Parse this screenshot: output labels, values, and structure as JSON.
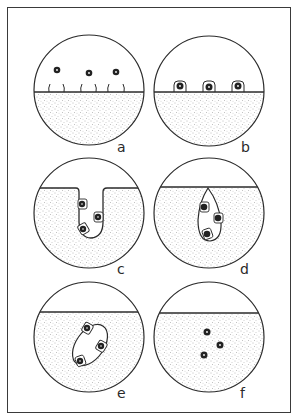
{
  "figure": {
    "colors": {
      "line": "#2b2b2b",
      "stipple": "#8a8a8a",
      "background": "#ffffff",
      "cell": "#222222"
    },
    "panels": [
      {
        "id": "a",
        "label": "a",
        "cx": 89,
        "cy": 90,
        "r": 55,
        "surface_y": 92,
        "label_pos": [
          118,
          138
        ],
        "stage": "free particles above surface with receptors"
      },
      {
        "id": "b",
        "label": "b",
        "cx": 209,
        "cy": 91,
        "r": 55,
        "surface_y": 92,
        "label_pos": [
          241,
          138
        ],
        "stage": "particles bound at surface"
      },
      {
        "id": "c",
        "label": "c",
        "cx": 89,
        "cy": 213,
        "r": 55,
        "surface_y": 188,
        "label_pos": [
          118,
          260
        ],
        "stage": "invagination of surface"
      },
      {
        "id": "d",
        "label": "d",
        "cx": 209,
        "cy": 213,
        "r": 55,
        "surface_y": 187,
        "label_pos": [
          240,
          260
        ],
        "stage": "vesicle pinching off"
      },
      {
        "id": "e",
        "label": "e",
        "cx": 89,
        "cy": 337,
        "r": 55,
        "surface_y": 312,
        "label_pos": [
          118,
          384
        ],
        "stage": "internal vesicle with particles"
      },
      {
        "id": "f",
        "label": "f",
        "cx": 209,
        "cy": 337,
        "r": 55,
        "surface_y": 313,
        "label_pos": [
          240,
          384
        ],
        "stage": "particles released inside"
      }
    ]
  }
}
